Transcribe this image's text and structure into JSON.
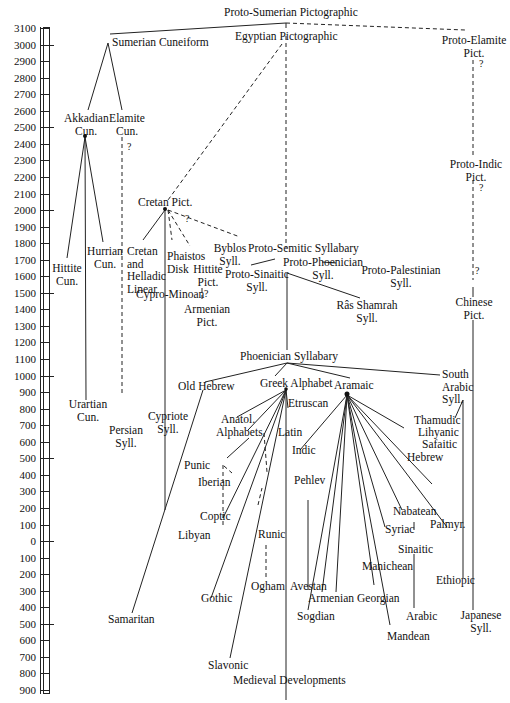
{
  "axis": {
    "ticks": [
      "3100",
      "3000",
      "2900",
      "2800",
      "2700",
      "2600",
      "2500",
      "2400",
      "2300",
      "2200",
      "2100",
      "2000",
      "1900",
      "1800",
      "1700",
      "1600",
      "1500",
      "1400",
      "1300",
      "1200",
      "1100",
      "1000",
      "900",
      "800",
      "700",
      "600",
      "500",
      "400",
      "300",
      "200",
      "100",
      "0",
      "100",
      "200",
      "300",
      "400",
      "500",
      "600",
      "700",
      "800",
      "900"
    ]
  },
  "nodes": {
    "proto_sumerian": "Proto-Sumerian Pictographic",
    "sumerian_cuneiform": "Sumerian Cuneiform",
    "egyptian_pict": "Egyptian Pictographic",
    "proto_elamite_1": "Proto-Elamite",
    "proto_elamite_2": "Pict.",
    "akkadian_1": "Akkadian",
    "akkadian_2": "Cun.",
    "elamite_1": "Elamite",
    "elamite_2": "Cun.",
    "proto_indic_1": "Proto-Indic",
    "proto_indic_2": "Pict.",
    "cretan_pict": "Cretan Pict.",
    "hurrian_1": "Hurrian",
    "hurrian_2": "Cun.",
    "hittite_cun_1": "Hittite",
    "hittite_cun_2": "Cun.",
    "cretan_linear_1": "Cretan",
    "cretan_linear_2": "and",
    "cretan_linear_3": "Helladic",
    "cretan_linear_4": "Linear",
    "phaistos_1": "Phaistos",
    "phaistos_2": "Disk",
    "hittite_pict_1": "Hittite",
    "hittite_pict_2": "Pict.",
    "byblos_1": "Byblos",
    "byblos_2": "Syll.",
    "proto_semitic": "Proto-Semitic Syllabary",
    "proto_phoenician_1": "Proto-Phoenician",
    "proto_phoenician_2": "Syll.",
    "proto_sinaitic_1": "Proto-Sinaitic",
    "proto_sinaitic_2": "Syll.",
    "proto_palestinian_1": "Proto-Palestinian",
    "proto_palestinian_2": "Syll.",
    "cypro_minoan": "Cypro-Minoan",
    "armenian_pict_1": "Armenian",
    "armenian_pict_2": "Pict.",
    "ras_shamrah_1": "Râs Shamrah",
    "ras_shamrah_2": "Syll.",
    "chinese_1": "Chinese",
    "chinese_2": "Pict.",
    "phoenician": "Phoenician Syllabary",
    "old_hebrew": "Old Hebrew",
    "greek": "Greek Alphabet",
    "aramaic": "Aramaic",
    "south_arabic_1": "South",
    "south_arabic_2": "Arabic",
    "south_arabic_3": "Syll.",
    "urartian_1": "Urartian",
    "urartian_2": "Cun.",
    "etruscan": "Etruscan",
    "cypriote_1": "Cypriote",
    "cypriote_2": "Syll.",
    "anatol_1": "Anatol.",
    "anatol_2": "Alphabets",
    "thamudic": "Thamudic",
    "lihyanic": "Lihyanic",
    "safaitic": "Safaitic",
    "persian_1": "Persian",
    "persian_2": "Syll.",
    "latin": "Latin",
    "indic": "Indic",
    "hebrew": "Hebrew",
    "punic": "Punic",
    "pehlev": "Pehlev",
    "iberian": "Iberian",
    "nabatean": "Nabatean",
    "syriac": "Syriac",
    "palmyr": "Palmyr.",
    "coptic": "Coptic",
    "runic": "Runic",
    "sinaitic": "Sinaitic",
    "libyan": "Libyan",
    "manichean": "Manichean",
    "ogham": "Ogham",
    "avestan": "Avestan",
    "ethiopic": "Ethiopic",
    "armenian": "Armenian",
    "georgian": "Georgian",
    "gothic": "Gothic",
    "samaritan": "Samaritan",
    "sogdian": "Sogdian",
    "arabic": "Arabic",
    "japanese_1": "Japanese",
    "japanese_2": "Syll.",
    "mandean": "Mandean",
    "slavonic": "Slavonic",
    "medieval": "Medieval Developments"
  },
  "question_mark": "?"
}
